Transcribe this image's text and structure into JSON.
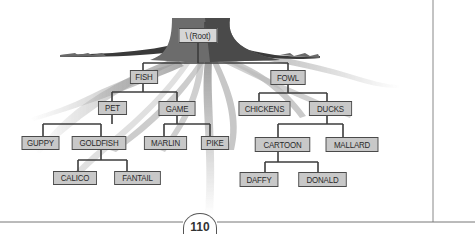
{
  "diagram": {
    "root": {
      "label": "\\ (Root)"
    },
    "nodes": {
      "root": "\\ (Root)",
      "fish": "FISH",
      "fowl": "FOWL",
      "pet": "PET",
      "game": "GAME",
      "chickens": "CHICKENS",
      "ducks": "DUCKS",
      "guppy": "GUPPY",
      "goldfish": "GOLDFISH",
      "marlin": "MARLIN",
      "pike": "PIKE",
      "cartoon": "CARTOON",
      "mallard": "MALLARD",
      "calico": "CALICO",
      "fantail": "FANTAIL",
      "daffy": "DAFFY",
      "donald": "DONALD"
    },
    "edges": [
      [
        "root",
        "fish"
      ],
      [
        "root",
        "fowl"
      ],
      [
        "fish",
        "pet"
      ],
      [
        "fish",
        "game"
      ],
      [
        "fowl",
        "chickens"
      ],
      [
        "fowl",
        "ducks"
      ],
      [
        "pet",
        "guppy"
      ],
      [
        "pet",
        "goldfish"
      ],
      [
        "game",
        "marlin"
      ],
      [
        "game",
        "pike"
      ],
      [
        "ducks",
        "cartoon"
      ],
      [
        "ducks",
        "mallard"
      ],
      [
        "goldfish",
        "calico"
      ],
      [
        "goldfish",
        "fantail"
      ],
      [
        "cartoon",
        "daffy"
      ],
      [
        "cartoon",
        "donald"
      ]
    ],
    "colors": {
      "node_fill": "#c8c8c8",
      "node_border": "#4a4a4a",
      "connector": "#3c3c3c",
      "root_trunk_dark": "#5a5a5a",
      "root_trunk_light": "#9a9a9a",
      "roots_faint": "#b8b8b8"
    }
  },
  "page": {
    "number": "110"
  }
}
